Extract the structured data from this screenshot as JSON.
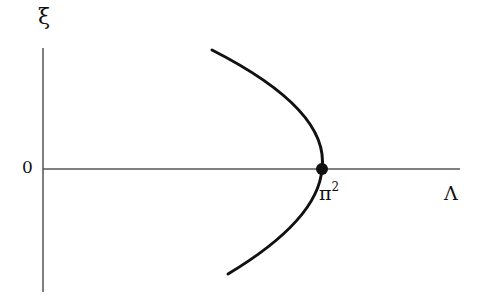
{
  "diagram": {
    "type": "bifurcation-diagram",
    "y_axis_label": "ξ",
    "x_axis_label": "Λ",
    "origin_label": "0",
    "bifurcation_point_label": "π",
    "bifurcation_point_exponent": "2",
    "curve": "parabola opening leftward (pitchfork), vertex at π² on Λ-axis",
    "colors": {
      "line": "#111111",
      "axis": "#555555",
      "background": "#ffffff"
    }
  }
}
